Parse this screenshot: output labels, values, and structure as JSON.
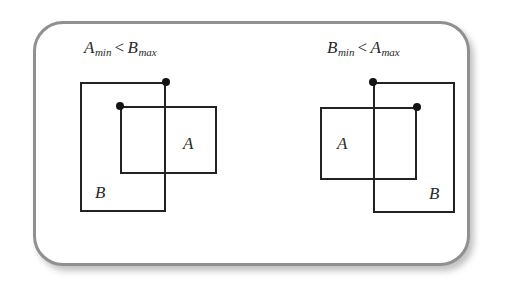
{
  "figure": {
    "background_color": "#ffffff",
    "frame_color": "#909090",
    "line_color": "#222222",
    "dot_color": "#141414",
    "text_color": "#2a2a2a"
  },
  "panels": [
    {
      "id": "left",
      "caption": {
        "first_var": "A",
        "first_sub": "min",
        "operator": "<",
        "second_var": "B",
        "second_sub": "max",
        "full_text": "A_min < B_max"
      },
      "rectangles": [
        {
          "label": "B",
          "x": 80,
          "y": 82,
          "width": 86,
          "height": 130,
          "label_x": 95,
          "label_y": 183,
          "dot_corner": "top-right",
          "dot_x": 166,
          "dot_y": 82
        },
        {
          "label": "A",
          "x": 120,
          "y": 106,
          "width": 97,
          "height": 68,
          "label_x": 183,
          "label_y": 134,
          "dot_corner": "top-left",
          "dot_x": 120,
          "dot_y": 106
        }
      ]
    },
    {
      "id": "right",
      "caption": {
        "first_var": "B",
        "first_sub": "min",
        "operator": "<",
        "second_var": "A",
        "second_sub": "max",
        "full_text": "B_min < A_max"
      },
      "rectangles": [
        {
          "label": "B",
          "x": 373,
          "y": 82,
          "width": 82,
          "height": 131,
          "label_x": 429,
          "label_y": 184,
          "dot_corner": "top-left",
          "dot_x": 373,
          "dot_y": 82
        },
        {
          "label": "A",
          "x": 320,
          "y": 107,
          "width": 97,
          "height": 73,
          "label_x": 337,
          "label_y": 134,
          "dot_corner": "top-right",
          "dot_x": 417,
          "dot_y": 107
        }
      ]
    }
  ]
}
